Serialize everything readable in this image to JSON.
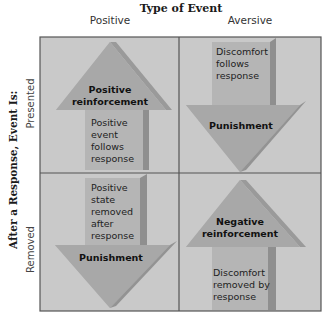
{
  "header": {
    "title": "Type of Event",
    "columns": [
      "Positive",
      "Aversive"
    ]
  },
  "rows": {
    "title": "After a Response, Event Is:",
    "labels": [
      "Presented",
      "Removed"
    ]
  },
  "cells": {
    "presented_positive": {
      "direction": "up",
      "heading": [
        "Positive",
        "reinforcement"
      ],
      "body": [
        "Positive",
        "event",
        "follows",
        "response"
      ]
    },
    "presented_aversive": {
      "direction": "down",
      "heading": [
        "Punishment"
      ],
      "body": [
        "Discomfort",
        "follows",
        "response"
      ]
    },
    "removed_positive": {
      "direction": "down",
      "heading": [
        "Punishment"
      ],
      "body": [
        "Positive",
        "state",
        "removed",
        "after",
        "response"
      ]
    },
    "removed_aversive": {
      "direction": "up",
      "heading": [
        "Negative",
        "reinforcement"
      ],
      "body": [
        "Discomfort",
        "removed by",
        "response"
      ]
    }
  },
  "colors": {
    "cell_bg": "#c9c9c9",
    "arrow_face": "#b3b3b3",
    "arrow_head": "#a6a6a6",
    "arrow_side": "#8f8f8f",
    "grid_line": "#555555"
  }
}
